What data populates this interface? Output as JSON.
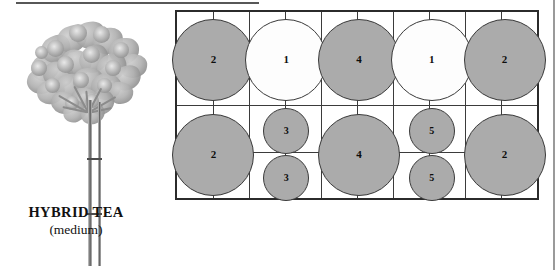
{
  "figure": {
    "caption_main": "HYBRID TEA",
    "caption_sub": "(medium)",
    "illustration_name": "hybrid-tea-rose-bush"
  },
  "plan": {
    "grid": {
      "columns": 10,
      "rows": 4,
      "width_px": 364,
      "height_px": 190
    },
    "colors": {
      "gray_fill": "#ababab",
      "white_fill": "#fdfdfd",
      "outline": "#3a3a3a",
      "border": "#2b2b2b"
    },
    "legend_note": "numbers indicate plant spacing class",
    "circles": [
      {
        "label": "2",
        "fill": "gray",
        "cx": 36.4,
        "cy": 47.5,
        "d": 82
      },
      {
        "label": "1",
        "fill": "white",
        "cx": 109.2,
        "cy": 47.5,
        "d": 82
      },
      {
        "label": "4",
        "fill": "gray",
        "cx": 182.0,
        "cy": 47.5,
        "d": 82
      },
      {
        "label": "1",
        "fill": "white",
        "cx": 254.8,
        "cy": 47.5,
        "d": 82
      },
      {
        "label": "2",
        "fill": "gray",
        "cx": 327.6,
        "cy": 47.5,
        "d": 82
      },
      {
        "label": "2",
        "fill": "gray",
        "cx": 36.4,
        "cy": 142.5,
        "d": 82
      },
      {
        "label": "3",
        "fill": "gray",
        "cx": 109.2,
        "cy": 118.8,
        "d": 46
      },
      {
        "label": "3",
        "fill": "gray",
        "cx": 109.2,
        "cy": 166.3,
        "d": 46
      },
      {
        "label": "4",
        "fill": "gray",
        "cx": 182.0,
        "cy": 142.5,
        "d": 82
      },
      {
        "label": "5",
        "fill": "gray",
        "cx": 254.8,
        "cy": 118.8,
        "d": 46
      },
      {
        "label": "5",
        "fill": "gray",
        "cx": 254.8,
        "cy": 166.3,
        "d": 46
      },
      {
        "label": "2",
        "fill": "gray",
        "cx": 327.6,
        "cy": 142.5,
        "d": 82
      }
    ]
  }
}
